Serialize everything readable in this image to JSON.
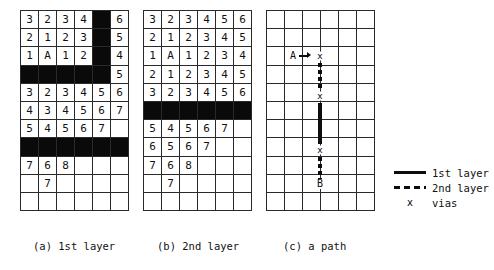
{
  "figure": {
    "captions": {
      "a": "(a) 1st layer",
      "b": "(b) 2nd layer",
      "c": "(c) a path"
    }
  },
  "grid_spec": {
    "columns": 6,
    "rows": 11,
    "blocked_color": "#0a0a0a",
    "line_color": "#2a2a2a"
  },
  "panel_a": {
    "name": "1st layer",
    "rows": [
      [
        "3",
        "2",
        "3",
        "4",
        "#",
        "6"
      ],
      [
        "2",
        "1",
        "2",
        "3",
        "#",
        "5"
      ],
      [
        "1",
        "A",
        "1",
        "2",
        "#",
        "4"
      ],
      [
        "#",
        "#",
        "#",
        "#",
        "#",
        "5"
      ],
      [
        "3",
        "2",
        "3",
        "4",
        "5",
        "6"
      ],
      [
        "4",
        "3",
        "4",
        "5",
        "6",
        "7"
      ],
      [
        "5",
        "4",
        "5",
        "6",
        "7",
        ""
      ],
      [
        "#",
        "#",
        "#",
        "#",
        "#",
        "#"
      ],
      [
        "7",
        "6",
        "8",
        "",
        "",
        ""
      ],
      [
        "",
        "7",
        "",
        "",
        "",
        ""
      ],
      [
        "",
        "",
        "",
        "",
        "",
        ""
      ]
    ]
  },
  "panel_b": {
    "name": "2nd layer",
    "rows": [
      [
        "3",
        "2",
        "3",
        "4",
        "5",
        "6"
      ],
      [
        "2",
        "1",
        "2",
        "3",
        "4",
        "5"
      ],
      [
        "1",
        "A",
        "1",
        "2",
        "3",
        "4"
      ],
      [
        "2",
        "1",
        "2",
        "3",
        "4",
        "5"
      ],
      [
        "3",
        "2",
        "3",
        "4",
        "5",
        "6"
      ],
      [
        "#",
        "#",
        "#",
        "#",
        "#",
        "#"
      ],
      [
        "5",
        "4",
        "5",
        "6",
        "7",
        ""
      ],
      [
        "6",
        "5",
        "6",
        "7",
        "",
        ""
      ],
      [
        "7",
        "6",
        "8",
        "",
        "",
        ""
      ],
      [
        "",
        "7",
        "",
        "",
        "",
        ""
      ],
      [
        "",
        "",
        "",
        "",
        "",
        ""
      ]
    ]
  },
  "panel_c": {
    "name": "a path",
    "rows": [
      [
        "",
        "",
        "",
        "",
        "",
        ""
      ],
      [
        "",
        "",
        "",
        "",
        "",
        ""
      ],
      [
        "",
        "",
        "",
        "",
        "",
        ""
      ],
      [
        "",
        "",
        "",
        "",
        "",
        ""
      ],
      [
        "",
        "",
        "",
        "",
        "",
        ""
      ],
      [
        "",
        "",
        "",
        "",
        "",
        ""
      ],
      [
        "",
        "",
        "",
        "",
        "",
        ""
      ],
      [
        "",
        "",
        "",
        "",
        "",
        ""
      ],
      [
        "",
        "",
        "",
        "",
        "",
        ""
      ],
      [
        "",
        "",
        "",
        "",
        "",
        ""
      ],
      [
        "",
        "",
        "",
        "",
        "",
        ""
      ]
    ],
    "terminals": {
      "source": "A",
      "target": "B"
    },
    "vias": [
      "x",
      "x",
      "x"
    ],
    "path_segments": [
      {
        "layer": "1st layer",
        "style": "solid"
      },
      {
        "layer": "2nd layer",
        "style": "dashed"
      },
      {
        "layer": "1st layer",
        "style": "solid"
      },
      {
        "layer": "2nd layer",
        "style": "dashed"
      }
    ]
  },
  "legend": {
    "items": [
      {
        "key": "solid-line",
        "label": "1st layer"
      },
      {
        "key": "dashed-line",
        "label": "2nd layer"
      },
      {
        "key": "x",
        "symbol": "x",
        "label": "vias"
      }
    ]
  }
}
